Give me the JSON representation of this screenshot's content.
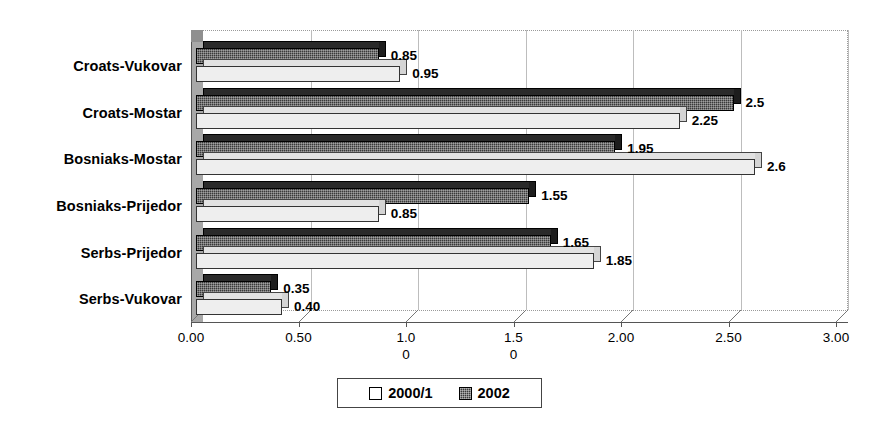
{
  "chart_data": {
    "type": "bar",
    "orientation": "horizontal",
    "title": "",
    "subtitle": "",
    "xlabel": "",
    "ylabel": "",
    "xlim": [
      0,
      3
    ],
    "grid": true,
    "legend_position": "bottom",
    "categories": [
      "Serbs-Vukovar",
      "Serbs-Prijedor",
      "Bosniaks-Prijedor",
      "Bosniaks-Mostar",
      "Croats-Mostar",
      "Croats-Vukovar"
    ],
    "series": [
      {
        "name": "2000/1",
        "style": "light",
        "values": [
          0.4,
          1.85,
          0.85,
          2.6,
          2.25,
          0.95
        ],
        "labels": [
          "0.40",
          "1.85",
          "0.85",
          "2.6",
          "2.25",
          "0.95"
        ]
      },
      {
        "name": "2002",
        "style": "dark",
        "values": [
          0.35,
          1.65,
          1.55,
          1.95,
          2.5,
          0.85
        ],
        "labels": [
          "0.35",
          "1.65",
          "1.55",
          "1.95",
          "2.5",
          "0.85"
        ]
      }
    ],
    "xticks": [
      0,
      0.5,
      1.0,
      1.5,
      2.0,
      2.5,
      3.0
    ],
    "xtick_labels": [
      "0.00",
      "0.50",
      "1.0\n0",
      "1.5\n0",
      "2.00",
      "2.50",
      "3.00"
    ]
  },
  "legend": {
    "entries": [
      {
        "label": "2000/1",
        "style": "light"
      },
      {
        "label": "2002",
        "style": "dark"
      }
    ]
  },
  "colors": {
    "series_light": "#eeeeee",
    "series_dark": "#3a3a3a",
    "grid": "#bdbdbd",
    "axis": "#555555",
    "text": "#000000",
    "background": "#ffffff"
  }
}
